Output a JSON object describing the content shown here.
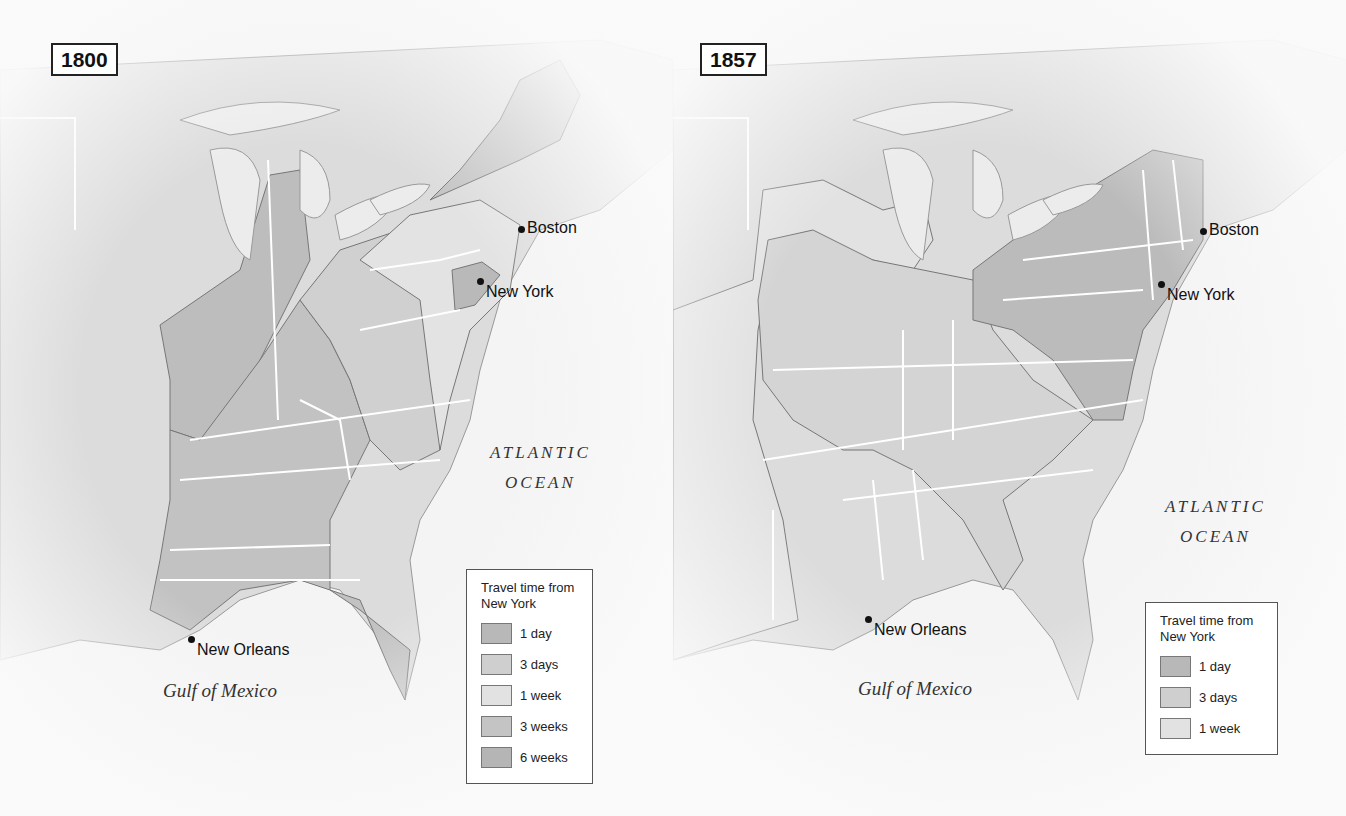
{
  "maps": [
    {
      "year": "1800",
      "cities": [
        {
          "name": "Boston"
        },
        {
          "name": "New York"
        },
        {
          "name": "New Orleans"
        }
      ],
      "water_labels": {
        "atlantic_line1": "ATLANTIC",
        "atlantic_line2": "OCEAN",
        "gulf": "Gulf of Mexico"
      },
      "legend": {
        "title": "Travel time from New York",
        "items": [
          {
            "label": "1 day",
            "color": "#b8b8b8"
          },
          {
            "label": "3 days",
            "color": "#cfcfcf"
          },
          {
            "label": "1 week",
            "color": "#e2e2e2"
          },
          {
            "label": "3 weeks",
            "color": "#c4c4c4"
          },
          {
            "label": "6 weeks",
            "color": "#b5b5b5"
          }
        ]
      }
    },
    {
      "year": "1857",
      "cities": [
        {
          "name": "Boston"
        },
        {
          "name": "New York"
        },
        {
          "name": "New Orleans"
        }
      ],
      "water_labels": {
        "atlantic_line1": "ATLANTIC",
        "atlantic_line2": "OCEAN",
        "gulf": "Gulf of Mexico"
      },
      "legend": {
        "title": "Travel time from New York",
        "items": [
          {
            "label": "1 day",
            "color": "#b8b8b8"
          },
          {
            "label": "3 days",
            "color": "#cfcfcf"
          },
          {
            "label": "1 week",
            "color": "#e2e2e2"
          }
        ]
      }
    }
  ],
  "colors": {
    "water": "#f2f2f2",
    "land_base": "#dcdcdc",
    "state_border": "#ffffff",
    "zone_outline": "#777777"
  }
}
